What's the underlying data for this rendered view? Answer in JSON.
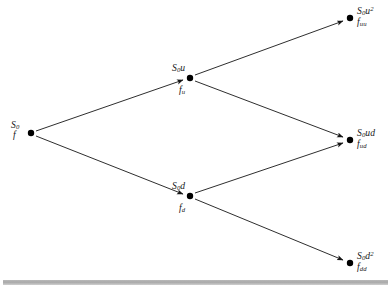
{
  "figure": {
    "type": "binomial-tree",
    "background_color": "#ffffff",
    "line_color": "#161616",
    "node_color": "#000000",
    "rule_color": "#b0b0b0",
    "cropped_header_text": ""
  },
  "nodes": [
    {
      "id": "root",
      "asset_label": "S",
      "asset_sub": "0",
      "asset_sup": "",
      "asset_tail": "",
      "value_label": "f",
      "value_sub": "",
      "x": 31,
      "y": 133,
      "label_position": "left"
    },
    {
      "id": "up",
      "asset_label": "S",
      "asset_sub": "0",
      "asset_sup": "",
      "asset_tail": "u",
      "value_label": "f",
      "value_sub": "u",
      "x": 190,
      "y": 78,
      "label_position": "above-below"
    },
    {
      "id": "down",
      "asset_label": "S",
      "asset_sub": "0",
      "asset_sup": "",
      "asset_tail": "d",
      "value_label": "f",
      "value_sub": "d",
      "x": 190,
      "y": 196,
      "label_position": "above-below"
    },
    {
      "id": "up-up",
      "asset_label": "S",
      "asset_sub": "0",
      "asset_sup": "2",
      "asset_tail": "u",
      "value_label": "f",
      "value_sub": "uu",
      "x": 350,
      "y": 18,
      "label_position": "right"
    },
    {
      "id": "up-down",
      "asset_label": "S",
      "asset_sub": "0",
      "asset_sup": "",
      "asset_tail": "ud",
      "value_label": "f",
      "value_sub": "ud",
      "x": 350,
      "y": 140,
      "label_position": "right"
    },
    {
      "id": "down-down",
      "asset_label": "S",
      "asset_sub": "0",
      "asset_sup": "2",
      "asset_tail": "d",
      "value_label": "f",
      "value_sub": "dd",
      "x": 350,
      "y": 263,
      "label_position": "right"
    }
  ],
  "edges": [
    {
      "id": "root-up",
      "from": "root",
      "to": "up",
      "direction": "up"
    },
    {
      "id": "root-down",
      "from": "root",
      "to": "down",
      "direction": "down"
    },
    {
      "id": "up-upup",
      "from": "up",
      "to": "up-up",
      "direction": "up"
    },
    {
      "id": "up-updown",
      "from": "up",
      "to": "up-down",
      "direction": "down"
    },
    {
      "id": "down-updown",
      "from": "down",
      "to": "up-down",
      "direction": "up"
    },
    {
      "id": "down-downdown",
      "from": "down",
      "to": "down-down",
      "direction": "down"
    }
  ],
  "labels": {
    "root_asset": "S0",
    "root_value": "f",
    "up_asset": "S0u",
    "up_value": "fu",
    "down_asset": "S0d",
    "down_value": "fd",
    "upup_asset": "S0u2",
    "upup_value": "fuu",
    "updown_asset": "S0ud",
    "updown_value": "fud",
    "downdown_asset": "S0d2",
    "downdown_value": "fdd"
  }
}
